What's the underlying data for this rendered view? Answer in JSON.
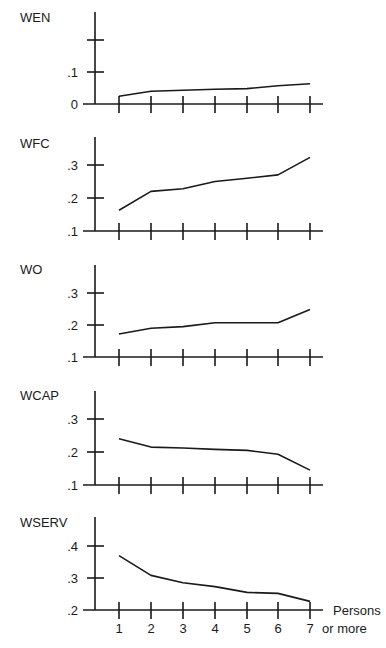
{
  "chart_data": {
    "type": "line",
    "layout": "vertically stacked small multiples, shared x-axis",
    "xlabel": "Persons",
    "x_categories": [
      "1",
      "2",
      "3",
      "4",
      "5",
      "6",
      "7"
    ],
    "x_last_suffix": "or more",
    "grid": false,
    "legend": null,
    "panels": [
      {
        "title": "WEN",
        "ylim": [
          0,
          0.2
        ],
        "yticks": [
          0,
          0.1,
          0.2
        ],
        "ytick_labels": [
          "0",
          ".1",
          ""
        ],
        "values": [
          0.024,
          0.04,
          0.043,
          0.046,
          0.048,
          0.057,
          0.063
        ]
      },
      {
        "title": "WFC",
        "ylim": [
          0.1,
          0.3
        ],
        "yticks": [
          0.1,
          0.2,
          0.3
        ],
        "ytick_labels": [
          ".1",
          ".2",
          ".3"
        ],
        "values": [
          0.163,
          0.22,
          0.228,
          0.25,
          0.26,
          0.27,
          0.323
        ]
      },
      {
        "title": "WO",
        "ylim": [
          0.1,
          0.3
        ],
        "yticks": [
          0.1,
          0.2,
          0.3
        ],
        "ytick_labels": [
          ".1",
          ".2",
          ".3"
        ],
        "values": [
          0.172,
          0.19,
          0.195,
          0.207,
          0.207,
          0.207,
          0.248
        ]
      },
      {
        "title": "WCAP",
        "ylim": [
          0.1,
          0.3
        ],
        "yticks": [
          0.1,
          0.2,
          0.3
        ],
        "ytick_labels": [
          ".1",
          ".2",
          ".3"
        ],
        "values": [
          0.24,
          0.215,
          0.212,
          0.208,
          0.205,
          0.193,
          0.145
        ]
      },
      {
        "title": "WSERV",
        "ylim": [
          0.2,
          0.4
        ],
        "yticks": [
          0.2,
          0.3,
          0.4
        ],
        "ytick_labels": [
          ".2",
          ".3",
          ".4"
        ],
        "values": [
          0.37,
          0.308,
          0.285,
          0.273,
          0.255,
          0.252,
          0.227
        ]
      }
    ]
  }
}
